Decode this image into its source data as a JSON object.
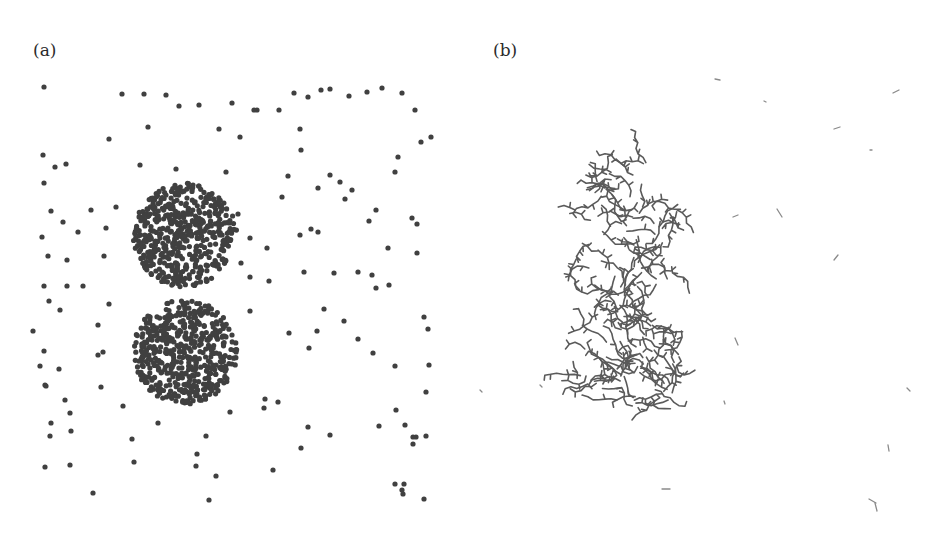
{
  "figure": {
    "panels": [
      {
        "label": "(a)",
        "description": "Scattered particles with two dense circular clusters",
        "dot_color": "#404040",
        "dot_radius": 2.6,
        "clusters": [
          {
            "cx": 185,
            "cy": 235,
            "r": 52,
            "count": 520
          },
          {
            "cx": 185,
            "cy": 352,
            "r": 52,
            "count": 520
          }
        ],
        "sparse_points": [
          [
            44,
            87
          ],
          [
            122,
            94
          ],
          [
            144,
            94
          ],
          [
            166,
            95
          ],
          [
            179,
            106
          ],
          [
            199,
            105
          ],
          [
            232,
            103
          ],
          [
            254,
            110
          ],
          [
            257,
            110
          ],
          [
            279,
            110
          ],
          [
            294,
            93
          ],
          [
            308,
            97
          ],
          [
            321,
            90
          ],
          [
            330,
            89
          ],
          [
            349,
            96
          ],
          [
            367,
            92
          ],
          [
            382,
            88
          ],
          [
            402,
            93
          ],
          [
            415,
            110
          ],
          [
            431,
            137
          ],
          [
            109,
            139
          ],
          [
            148,
            127
          ],
          [
            219,
            129
          ],
          [
            240,
            137
          ],
          [
            300,
            129
          ],
          [
            43,
            155
          ],
          [
            55,
            167
          ],
          [
            66,
            164
          ],
          [
            140,
            165
          ],
          [
            176,
            169
          ],
          [
            226,
            172
          ],
          [
            288,
            176
          ],
          [
            301,
            150
          ],
          [
            318,
            188
          ],
          [
            330,
            175
          ],
          [
            340,
            182
          ],
          [
            395,
            172
          ],
          [
            398,
            157
          ],
          [
            421,
            142
          ],
          [
            44,
            183
          ],
          [
            51,
            211
          ],
          [
            42,
            237
          ],
          [
            63,
            222
          ],
          [
            78,
            232
          ],
          [
            106,
            228
          ],
          [
            116,
            207
          ],
          [
            91,
            210
          ],
          [
            238,
            214
          ],
          [
            250,
            238
          ],
          [
            267,
            248
          ],
          [
            282,
            197
          ],
          [
            300,
            235
          ],
          [
            311,
            229
          ],
          [
            318,
            232
          ],
          [
            345,
            199
          ],
          [
            352,
            190
          ],
          [
            369,
            221
          ],
          [
            376,
            210
          ],
          [
            388,
            248
          ],
          [
            412,
            218
          ],
          [
            417,
            224
          ],
          [
            48,
            256
          ],
          [
            67,
            260
          ],
          [
            44,
            286
          ],
          [
            60,
            310
          ],
          [
            49,
            301
          ],
          [
            67,
            286
          ],
          [
            83,
            286
          ],
          [
            104,
            256
          ],
          [
            98,
            325
          ],
          [
            109,
            304
          ],
          [
            241,
            263
          ],
          [
            250,
            277
          ],
          [
            269,
            281
          ],
          [
            304,
            272
          ],
          [
            334,
            273
          ],
          [
            358,
            272
          ],
          [
            372,
            275
          ],
          [
            376,
            288
          ],
          [
            389,
            285
          ],
          [
            417,
            253
          ],
          [
            33,
            331
          ],
          [
            44,
            351
          ],
          [
            40,
            366
          ],
          [
            45,
            385
          ],
          [
            59,
            369
          ],
          [
            98,
            355
          ],
          [
            103,
            352
          ],
          [
            101,
            387
          ],
          [
            250,
            311
          ],
          [
            289,
            333
          ],
          [
            309,
            348
          ],
          [
            317,
            331
          ],
          [
            324,
            309
          ],
          [
            344,
            321
          ],
          [
            358,
            339
          ],
          [
            373,
            353
          ],
          [
            395,
            366
          ],
          [
            424,
            317
          ],
          [
            428,
            329
          ],
          [
            429,
            365
          ],
          [
            426,
            392
          ],
          [
            46,
            386
          ],
          [
            65,
            400
          ],
          [
            70,
            413
          ],
          [
            51,
            423
          ],
          [
            50,
            436
          ],
          [
            71,
            431
          ],
          [
            45,
            467
          ],
          [
            70,
            465
          ],
          [
            93,
            493
          ],
          [
            123,
            406
          ],
          [
            132,
            439
          ],
          [
            134,
            462
          ],
          [
            158,
            423
          ],
          [
            196,
            393
          ],
          [
            197,
            454
          ],
          [
            196,
            466
          ],
          [
            206,
            436
          ],
          [
            209,
            500
          ],
          [
            216,
            476
          ],
          [
            230,
            412
          ],
          [
            265,
            399
          ],
          [
            264,
            408
          ],
          [
            278,
            402
          ],
          [
            273,
            470
          ],
          [
            301,
            448
          ],
          [
            308,
            427
          ],
          [
            330,
            435
          ],
          [
            379,
            426
          ],
          [
            396,
            410
          ],
          [
            405,
            425
          ],
          [
            413,
            437
          ],
          [
            413,
            444
          ],
          [
            416,
            437
          ],
          [
            426,
            436
          ],
          [
            395,
            484
          ],
          [
            404,
            484
          ],
          [
            402,
            490
          ],
          [
            424,
            499
          ],
          [
            403,
            494
          ]
        ]
      },
      {
        "label": "(b)",
        "description": "Branched fibrous network aggregates with sparse short fragments",
        "line_color": "#5a5a5a",
        "network_regions": [
          {
            "cx": 630,
            "cy": 232,
            "rx": 58,
            "ry": 75
          },
          {
            "cx": 628,
            "cy": 350,
            "rx": 58,
            "ry": 65
          }
        ],
        "fragments": [
          [
            715,
            79,
            720,
            80
          ],
          [
            764,
            101,
            766,
            102
          ],
          [
            893,
            93,
            899,
            90
          ],
          [
            834,
            129,
            840,
            127
          ],
          [
            870,
            150,
            872,
            150
          ],
          [
            733,
            217,
            738,
            215
          ],
          [
            777,
            209,
            782,
            217
          ],
          [
            738,
            345,
            735,
            338
          ],
          [
            834,
            260,
            838,
            255
          ],
          [
            907,
            388,
            910,
            391
          ],
          [
            888,
            445,
            889,
            451
          ],
          [
            662,
            489,
            670,
            489
          ],
          [
            869,
            499,
            876,
            503
          ],
          [
            875,
            503,
            877,
            511
          ],
          [
            724,
            401,
            725,
            404
          ],
          [
            480,
            390,
            482,
            392
          ],
          [
            540,
            385,
            542,
            387
          ]
        ]
      }
    ]
  }
}
